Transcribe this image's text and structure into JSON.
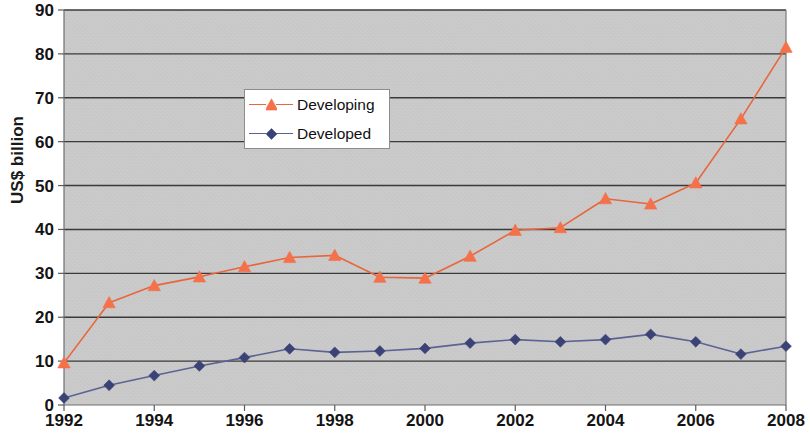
{
  "chart_data": {
    "type": "line",
    "title": "",
    "subtitle": "",
    "xlabel": "",
    "ylabel": "US$ billion",
    "x": [
      1992,
      1993,
      1994,
      1995,
      1996,
      1997,
      1998,
      1999,
      2000,
      2001,
      2002,
      2003,
      2004,
      2005,
      2006,
      2007,
      2008
    ],
    "xtick_labels": [
      "1992",
      "1994",
      "1996",
      "1998",
      "2000",
      "2002",
      "2004",
      "2006",
      "2008"
    ],
    "xtick_values": [
      1992,
      1994,
      1996,
      1998,
      2000,
      2002,
      2004,
      2006,
      2008
    ],
    "ytick_labels": [
      "0",
      "10",
      "20",
      "30",
      "40",
      "50",
      "60",
      "70",
      "80",
      "90"
    ],
    "ytick_values": [
      0,
      10,
      20,
      30,
      40,
      50,
      60,
      70,
      80,
      90
    ],
    "xlim": [
      1992,
      2008
    ],
    "ylim": [
      0,
      90
    ],
    "grid": "horizontal",
    "legend_position": "upper-left-inside",
    "plot_background": "#c9c9c9",
    "series": [
      {
        "name": "Developing",
        "color": "#e8663c",
        "marker": "triangle",
        "marker_color": "#f4714a",
        "values": [
          9.6,
          23.3,
          27.2,
          29.2,
          31.5,
          33.6,
          34.1,
          29.1,
          28.9,
          33.9,
          39.8,
          40.4,
          47.0,
          45.8,
          50.6,
          65.2,
          81.5
        ]
      },
      {
        "name": "Developed",
        "color": "#5c6394",
        "marker": "diamond",
        "marker_color": "#3b4376",
        "values": [
          1.6,
          4.5,
          6.7,
          8.9,
          10.8,
          12.8,
          12.0,
          12.3,
          12.9,
          14.1,
          14.9,
          14.4,
          14.9,
          16.1,
          14.4,
          11.6,
          13.4
        ]
      }
    ]
  },
  "legend": {
    "items": [
      {
        "label": "Developing"
      },
      {
        "label": "Developed"
      }
    ]
  },
  "axes": {
    "y_title": "US$ billion"
  }
}
